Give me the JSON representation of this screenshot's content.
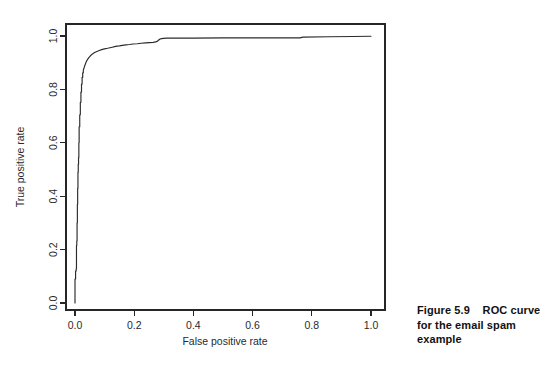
{
  "figure": {
    "caption_lines": [
      "Figure 5.9    ROC curve",
      "for the email spam",
      "example"
    ],
    "caption_full": "Figure 5.9    ROC curve for the email spam example"
  },
  "chart_data": {
    "type": "line",
    "title": "",
    "subtitle": "",
    "xlabel": "False positive rate",
    "ylabel": "True positive rate",
    "xlim": [
      0.0,
      1.0
    ],
    "ylim": [
      0.0,
      1.0
    ],
    "xticks": [
      "0.0",
      "0.2",
      "0.4",
      "0.6",
      "0.8",
      "1.0"
    ],
    "yticks": [
      "0.0",
      "0.2",
      "0.4",
      "0.6",
      "0.8",
      "1.0"
    ],
    "xtick_values": [
      0.0,
      0.2,
      0.4,
      0.6,
      0.8,
      1.0
    ],
    "ytick_values": [
      0.0,
      0.2,
      0.4,
      0.6,
      0.8,
      1.0
    ],
    "grid": false,
    "legend": null,
    "legend_position": "none",
    "annotations": [],
    "line_color": "#2b2b2b",
    "axis_color": "#262626",
    "background_color": "#ffffff",
    "series": [
      {
        "name": "ROC curve",
        "x": [
          0.0,
          0.0,
          0.002,
          0.002,
          0.004,
          0.004,
          0.005,
          0.005,
          0.006,
          0.006,
          0.007,
          0.007,
          0.008,
          0.008,
          0.009,
          0.009,
          0.01,
          0.01,
          0.011,
          0.011,
          0.012,
          0.012,
          0.013,
          0.013,
          0.014,
          0.014,
          0.016,
          0.016,
          0.018,
          0.018,
          0.02,
          0.02,
          0.022,
          0.022,
          0.024,
          0.024,
          0.026,
          0.026,
          0.028,
          0.028,
          0.03,
          0.032,
          0.036,
          0.04,
          0.046,
          0.052,
          0.058,
          0.066,
          0.074,
          0.082,
          0.09,
          0.1,
          0.11,
          0.118,
          0.126,
          0.134,
          0.142,
          0.15,
          0.16,
          0.172,
          0.184,
          0.196,
          0.21,
          0.224,
          0.238,
          0.252,
          0.264,
          0.272,
          0.278,
          0.282,
          0.286,
          0.292,
          0.3,
          0.31,
          0.4,
          0.5,
          0.6,
          0.7,
          0.76,
          0.77,
          0.86,
          0.94,
          1.0
        ],
        "y": [
          0.0,
          0.09,
          0.09,
          0.12,
          0.12,
          0.128,
          0.128,
          0.215,
          0.215,
          0.232,
          0.232,
          0.3,
          0.3,
          0.37,
          0.37,
          0.43,
          0.43,
          0.49,
          0.49,
          0.52,
          0.52,
          0.545,
          0.545,
          0.6,
          0.6,
          0.66,
          0.66,
          0.705,
          0.705,
          0.752,
          0.752,
          0.79,
          0.79,
          0.82,
          0.82,
          0.845,
          0.845,
          0.862,
          0.862,
          0.872,
          0.878,
          0.886,
          0.898,
          0.908,
          0.918,
          0.926,
          0.932,
          0.938,
          0.942,
          0.946,
          0.949,
          0.952,
          0.954,
          0.956,
          0.958,
          0.96,
          0.962,
          0.963,
          0.965,
          0.967,
          0.968,
          0.97,
          0.971,
          0.973,
          0.974,
          0.975,
          0.976,
          0.978,
          0.98,
          0.984,
          0.988,
          0.99,
          0.991,
          0.992,
          0.992,
          0.993,
          0.993,
          0.993,
          0.993,
          0.996,
          0.997,
          0.998,
          0.999
        ]
      }
    ]
  }
}
